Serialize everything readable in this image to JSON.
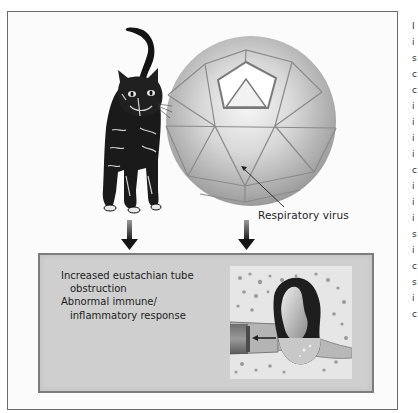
{
  "figure": {
    "virus_label": "Respiratory virus",
    "subjects": [
      {
        "name": "cat",
        "description": "Cat (allergen exposure)"
      },
      {
        "name": "respiratory-virus",
        "description": "Icosahedral respiratory virus particle"
      }
    ],
    "outcome_box": {
      "lines": [
        {
          "text": "Increased eustachian tube",
          "indent": false
        },
        {
          "text": "obstruction",
          "indent": true
        },
        {
          "text": "Abnormal immune/",
          "indent": false
        },
        {
          "text": "inflammatory response",
          "indent": true
        }
      ],
      "illustration": "Middle ear with eustachian tube and effusion"
    },
    "colors": {
      "frame_border": "#6a6a6a",
      "outcome_bg": "#cfcfcf",
      "outcome_border": "#7d7d7d",
      "arrow": "#1a1a1a",
      "sphere_light": "#f4f4f4",
      "sphere_dark": "#9c9c9c"
    }
  },
  "side_text_fragments": [
    "I",
    "i",
    "s",
    "c",
    "c",
    "i",
    "i",
    "i",
    "i",
    "c",
    "i",
    "i",
    "i",
    "s",
    "i",
    "c",
    "s",
    "i",
    "c"
  ]
}
